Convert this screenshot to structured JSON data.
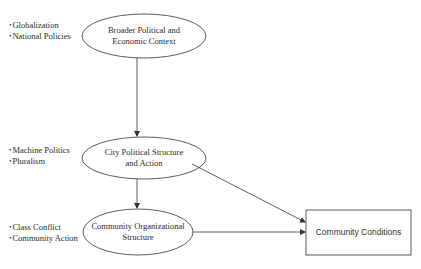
{
  "nodes": {
    "broader": {
      "label_line1": "Broader Political and",
      "label_line2": "Economic Context",
      "shape": "ellipse",
      "factors": [
        "Globalization",
        "National Policies"
      ]
    },
    "city": {
      "label_line1": "City Political Structure",
      "label_line2": "and Action",
      "shape": "ellipse",
      "factors": [
        "Machine Politics",
        "Pluralism"
      ]
    },
    "community_org": {
      "label_line1": "Community Organizational",
      "label_line2": "Structure",
      "shape": "ellipse",
      "factors": [
        "Class Conflict",
        "Community Action"
      ]
    },
    "conditions": {
      "label": "Community Conditions",
      "shape": "rectangle"
    }
  },
  "edges": [
    {
      "from": "Broader Political and Economic Context",
      "to": "City Political Structure and Action"
    },
    {
      "from": "City Political Structure and Action",
      "to": "Community Organizational Structure"
    },
    {
      "from": "City Political Structure and Action",
      "to": "Community Conditions"
    },
    {
      "from": "Community Organizational Structure",
      "to": "Community Conditions"
    }
  ],
  "colors": {
    "stroke": "#333333",
    "text": "#2a2a2a",
    "background": "#ffffff"
  }
}
